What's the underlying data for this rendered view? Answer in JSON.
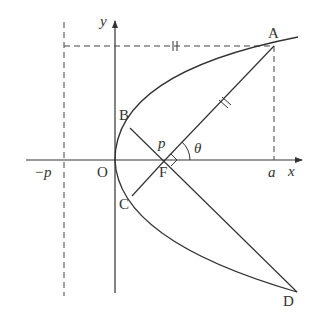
{
  "figure": {
    "type": "parabola focal chord diagram",
    "axes": {
      "x_label": "x",
      "y_label": "y",
      "origin_label": "O"
    },
    "points": {
      "A": "A",
      "B": "B",
      "C": "C",
      "D": "D",
      "F": "F"
    },
    "annotations": {
      "directrix_label": "−p",
      "a_label": "a",
      "p_label": "p",
      "theta_label": "θ"
    },
    "colors": {
      "stroke": "#333333",
      "background": "#ffffff"
    }
  }
}
